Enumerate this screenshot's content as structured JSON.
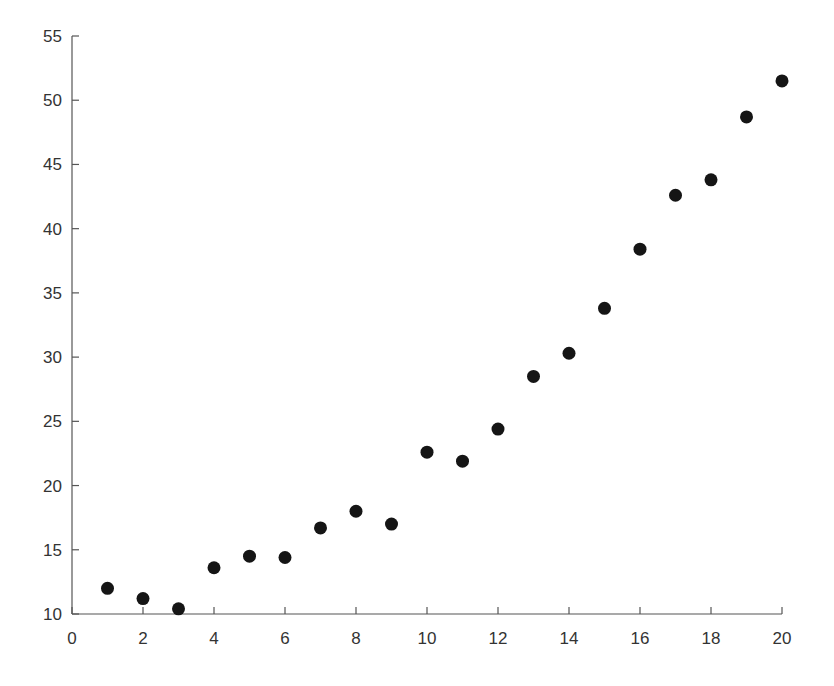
{
  "chart_data": {
    "type": "scatter",
    "title": "",
    "xlabel": "",
    "ylabel": "",
    "xlim": [
      0,
      20
    ],
    "ylim": [
      10,
      55
    ],
    "grid": false,
    "legend": null,
    "x_ticks": [
      0,
      2,
      4,
      6,
      8,
      10,
      12,
      14,
      16,
      18,
      20
    ],
    "y_ticks": [
      10,
      15,
      20,
      25,
      30,
      35,
      40,
      45,
      50,
      55
    ],
    "marker": {
      "shape": "circle",
      "color": "#151515",
      "radius_px": 6.5
    },
    "series": [
      {
        "name": "data",
        "x": [
          1,
          2,
          3,
          4,
          5,
          6,
          7,
          8,
          9,
          10,
          11,
          12,
          13,
          14,
          15,
          16,
          17,
          18,
          19,
          20
        ],
        "y": [
          12.0,
          11.2,
          10.4,
          13.6,
          14.5,
          14.4,
          16.7,
          18.0,
          17.0,
          22.6,
          21.9,
          24.4,
          28.5,
          30.3,
          33.8,
          38.4,
          42.6,
          43.8,
          48.7,
          51.5
        ]
      }
    ]
  },
  "colors": {
    "axis": "#555555",
    "text": "#333333",
    "marker": "#151515",
    "background": "#ffffff"
  }
}
